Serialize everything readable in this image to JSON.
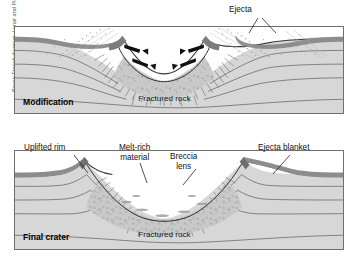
{
  "figure": {
    "credit": "Bevan French diagram, Lunar and Planetary Institute",
    "colors": {
      "bedrock": "#d7d7d7",
      "breccia": "#c9c9c9",
      "surface_layer": "#8d8d8d",
      "frame": "#6f6f6f",
      "stratum_line": "#5a5a5a",
      "fracture": "#6b6b6b",
      "arrow": "#111111",
      "background": "#ffffff"
    }
  },
  "panels": [
    {
      "id": "modification",
      "stage_label": "Modification",
      "callouts": [
        {
          "name": "ejecta",
          "text": "Ejecta"
        }
      ],
      "inner_labels": [
        {
          "name": "fractured-rock",
          "text": "Fractured rock"
        }
      ],
      "arrows": [
        {
          "name": "collapse-arrow-left-upper",
          "direction": "inward-right"
        },
        {
          "name": "collapse-arrow-left-lower",
          "direction": "inward-right"
        },
        {
          "name": "collapse-arrow-right-upper",
          "direction": "inward-left"
        },
        {
          "name": "collapse-arrow-right-lower",
          "direction": "inward-left"
        }
      ],
      "features": [
        "ejecta-plume-left",
        "ejecta-plume-right",
        "transient-crater",
        "breccia-fill",
        "fracture-zone",
        "layered-bedrock"
      ]
    },
    {
      "id": "final-crater",
      "stage_label": "Final crater",
      "callouts": [
        {
          "name": "uplifted-rim",
          "text": "Uplifted rim"
        },
        {
          "name": "melt-rich-material",
          "text": "Melt-rich\nmaterial"
        },
        {
          "name": "breccia-lens",
          "text": "Breccia\nlens"
        },
        {
          "name": "ejecta-blanket",
          "text": "Ejecta blanket"
        }
      ],
      "inner_labels": [
        {
          "name": "fractured-rock",
          "text": "Fractured rock"
        }
      ],
      "features": [
        "uplifted-rim-left",
        "uplifted-rim-right",
        "breccia-lens",
        "melt-rich-zone",
        "fracture-zone",
        "layered-bedrock",
        "ejecta-blanket-drape"
      ]
    }
  ],
  "labels": {
    "ejecta": "Ejecta",
    "fractured_rock_top": "Fractured rock",
    "fractured_rock_bottom": "Fractured rock",
    "modification": "Modification",
    "final_crater": "Final crater",
    "uplifted_rim": "Uplifted rim",
    "melt_rich_line1": "Melt-rich",
    "melt_rich_line2": "material",
    "breccia_line1": "Breccia",
    "breccia_line2": "lens",
    "ejecta_blanket": "Ejecta blanket"
  }
}
